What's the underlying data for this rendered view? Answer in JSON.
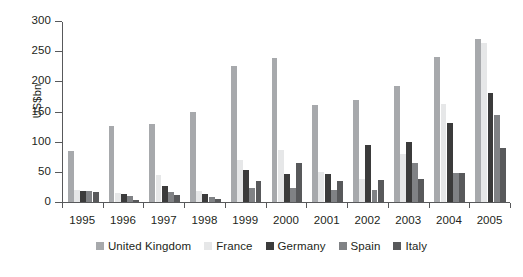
{
  "chart_data": {
    "type": "bar",
    "title": "",
    "xlabel": "",
    "ylabel": "US$bn",
    "ylim": [
      0,
      300
    ],
    "yticks": [
      0,
      50,
      100,
      150,
      200,
      250,
      300
    ],
    "grid": false,
    "legend_position": "bottom",
    "categories": [
      "1995",
      "1996",
      "1997",
      "1998",
      "1999",
      "2000",
      "2001",
      "2002",
      "2003",
      "2004",
      "2005"
    ],
    "series": [
      {
        "name": "United Kingdom",
        "color": "#a7a9ac",
        "values": [
          84,
          126,
          129,
          150,
          226,
          238,
          161,
          169,
          193,
          241,
          270
        ]
      },
      {
        "name": "France",
        "color": "#e6e7e8",
        "values": [
          20,
          15,
          44,
          19,
          70,
          86,
          50,
          38,
          80,
          162,
          263
        ]
      },
      {
        "name": "Germany",
        "color": "#3b3b3b",
        "values": [
          18,
          14,
          26,
          14,
          53,
          46,
          47,
          95,
          100,
          131,
          181
        ]
      },
      {
        "name": "Spain",
        "color": "#808285",
        "values": [
          18,
          10,
          17,
          9,
          24,
          24,
          20,
          20,
          65,
          48,
          145
        ]
      },
      {
        "name": "Italy",
        "color": "#58595b",
        "values": [
          17,
          4,
          11,
          5,
          35,
          64,
          35,
          37,
          38,
          48,
          90
        ]
      }
    ]
  }
}
